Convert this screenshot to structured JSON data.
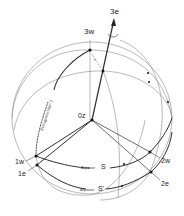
{
  "diagram": {
    "type": "celestial-sphere-coordinate-rotation",
    "axis_labels": {
      "x3e": "3e",
      "x3w": "3w",
      "origin": "0z",
      "x1w": "1w",
      "x1e": "1e",
      "x2w": "2w",
      "x2e": "2e"
    },
    "equator_labels": {
      "s": "Äquator S",
      "s_word": "Äquator",
      "s_letter": "S",
      "s_prime_word": "Äquator",
      "s_prime_letter": "S'"
    },
    "meridian_label": "Bezugsmeridian 1",
    "angle_label": "ε",
    "colors": {
      "line": "#3a3a3a",
      "thin_line": "#8a8a8a",
      "text": "#222222",
      "background": "#ffffff"
    }
  }
}
